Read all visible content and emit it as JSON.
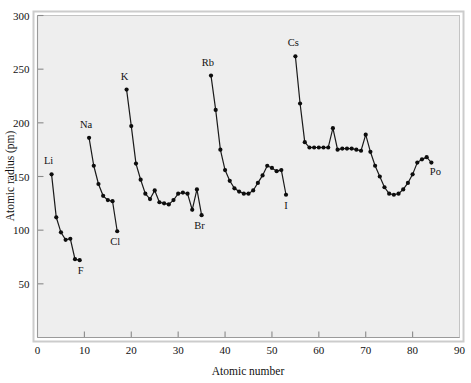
{
  "chart_data": {
    "type": "line",
    "title": "",
    "xlabel": "Atomic number",
    "ylabel": "Atomic radius (pm)",
    "xlim": [
      0,
      90
    ],
    "ylim": [
      0,
      300
    ],
    "xticks": [
      0,
      10,
      20,
      30,
      40,
      50,
      60,
      70,
      80,
      90
    ],
    "yticks": [
      50,
      100,
      150,
      200,
      250,
      300
    ],
    "grid": false,
    "legend": "none",
    "marker": "filled-circle",
    "line_color": "#1a1a1a",
    "marker_color": "#0d0d0d",
    "plot_background": "#eeeeee",
    "frame_color": "#c4c4c4",
    "series": [
      {
        "name": "Period 2",
        "x": [
          3,
          4,
          5,
          6,
          7,
          8,
          9
        ],
        "y": [
          152,
          112,
          98,
          91,
          92,
          73,
          72
        ]
      },
      {
        "name": "Period 3",
        "x": [
          11,
          12,
          13,
          14,
          15,
          16,
          17
        ],
        "y": [
          186,
          160,
          143,
          132,
          128,
          127,
          99
        ]
      },
      {
        "name": "Period 4",
        "x": [
          19,
          20,
          21,
          22,
          23,
          24,
          25,
          26,
          27,
          28,
          29,
          30,
          31,
          32,
          33,
          34,
          35
        ],
        "y": [
          231,
          197,
          162,
          147,
          134,
          129,
          137,
          126,
          125,
          124,
          128,
          134,
          135,
          134,
          119,
          138,
          114
        ]
      },
      {
        "name": "Period 5",
        "x": [
          37,
          38,
          39,
          40,
          41,
          42,
          43,
          44,
          45,
          46,
          47,
          48,
          49,
          50,
          51,
          52,
          53
        ],
        "y": [
          244,
          212,
          175,
          156,
          146,
          139,
          136,
          134,
          134,
          137,
          144,
          151,
          160,
          158,
          155,
          156,
          133
        ]
      },
      {
        "name": "Period 6",
        "x": [
          55,
          56,
          57,
          58,
          59,
          60,
          61,
          62,
          63,
          64,
          65,
          66,
          67,
          68,
          69,
          70,
          71,
          72,
          73,
          74,
          75,
          76,
          77,
          78,
          79,
          80,
          81,
          82,
          83,
          84
        ],
        "y": [
          262,
          218,
          182,
          177,
          177,
          177,
          177,
          177,
          195,
          175,
          176,
          176,
          176,
          175,
          174,
          189,
          173,
          160,
          150,
          140,
          134,
          133,
          134,
          138,
          144,
          152,
          163,
          166,
          168,
          163
        ]
      }
    ],
    "point_labels": [
      {
        "text": "Li",
        "x": 3,
        "y": 152,
        "dx": -3,
        "dy": -10
      },
      {
        "text": "F",
        "x": 9,
        "y": 72,
        "dx": 1,
        "dy": 14
      },
      {
        "text": "Na",
        "x": 11,
        "y": 186,
        "dx": -3,
        "dy": -10
      },
      {
        "text": "Cl",
        "x": 17,
        "y": 99,
        "dx": -2,
        "dy": 14
      },
      {
        "text": "K",
        "x": 19,
        "y": 231,
        "dx": -2,
        "dy": -10
      },
      {
        "text": "Br",
        "x": 35,
        "y": 114,
        "dx": -2,
        "dy": 14
      },
      {
        "text": "Rb",
        "x": 37,
        "y": 244,
        "dx": -3,
        "dy": -10
      },
      {
        "text": "I",
        "x": 53,
        "y": 133,
        "dx": 0,
        "dy": 14
      },
      {
        "text": "Cs",
        "x": 55,
        "y": 262,
        "dx": -2,
        "dy": -10
      },
      {
        "text": "Po",
        "x": 84,
        "y": 163,
        "dx": 4,
        "dy": 12
      }
    ]
  }
}
